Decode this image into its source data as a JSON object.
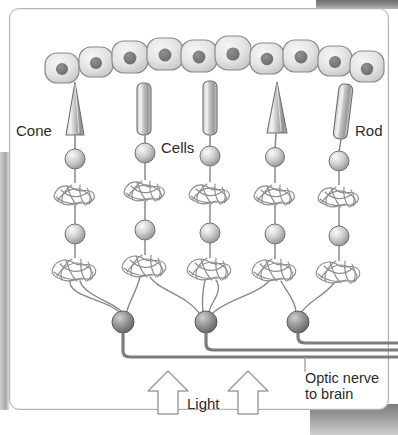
{
  "diagram": {
    "labels": {
      "cone": "Cone",
      "rod": "Rod",
      "cells": "Cells",
      "light": "Light",
      "optic_nerve_line1": "Optic nerve",
      "optic_nerve_line2": "to brain"
    },
    "colors": {
      "cell_fill": "#e9e9e9",
      "cell_stroke": "#8a8a8a",
      "nucleus": "#777777",
      "receptor_gray": "#b5b5b5",
      "receptor_stroke": "#6f6f6f",
      "tangle_stroke": "#8f8f8f",
      "nerve_gray": "#7c7c7c",
      "text": "#2b2b2b",
      "frame_border": "#b4b4b4",
      "arrow_outline": "#9a9a9a",
      "page_edge": "#8d8d8d"
    },
    "counts": {
      "epithelium_cells": 10,
      "photoreceptors": 5,
      "cones": 2,
      "rods": 3,
      "bipolar_cells": 5,
      "ganglion_cells": 3,
      "optic_nerve_fibers": 3,
      "light_arrows": 2
    },
    "photoreceptor_types": [
      "cone",
      "rod",
      "rod",
      "cone",
      "rod"
    ],
    "columns_x": [
      75,
      145,
      210,
      275,
      340
    ],
    "epithelium_cells_x": [
      62,
      96,
      130,
      164,
      198,
      232,
      266,
      300,
      334,
      366
    ],
    "ganglion_x": [
      123,
      206,
      298
    ],
    "light_arrows_x": [
      168,
      248
    ]
  }
}
